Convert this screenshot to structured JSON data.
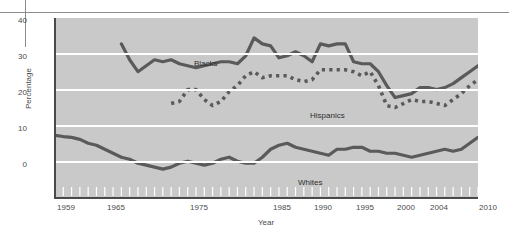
{
  "chart_data": {
    "type": "line",
    "title": "",
    "xlabel": "Year",
    "ylabel": "Percentage",
    "ylim": [
      0,
      45
    ],
    "xlim": [
      1959,
      2010
    ],
    "yticks": [
      0,
      10,
      20,
      30,
      40
    ],
    "xticks": [
      1959,
      1965,
      1975,
      1985,
      1990,
      1995,
      2000,
      2004,
      2010
    ],
    "grid": true,
    "legend_position": "inline-annotations",
    "plot_background": "#c9c9c9",
    "gridline_color": "#ffffff",
    "line_color": "#5a5a5a",
    "series": [
      {
        "name": "Blacks",
        "style": "solid",
        "color": "#5a5a5a",
        "x": [
          1967,
          1968,
          1969,
          1970,
          1971,
          1972,
          1973,
          1974,
          1975,
          1976,
          1977,
          1978,
          1979,
          1980,
          1981,
          1982,
          1983,
          1984,
          1985,
          1986,
          1987,
          1988,
          1989,
          1990,
          1991,
          1992,
          1993,
          1994,
          1995,
          1996,
          1997,
          1998,
          1999,
          2000,
          2001,
          2002,
          2003,
          2004,
          2005,
          2006,
          2007,
          2008,
          2009,
          2010
        ],
        "values": [
          38.5,
          34.5,
          31.5,
          33.0,
          34.5,
          34.0,
          34.5,
          33.5,
          33.0,
          32.5,
          33.0,
          33.5,
          34.0,
          34.0,
          33.5,
          35.5,
          40.0,
          38.5,
          38.0,
          35.0,
          35.5,
          36.5,
          35.5,
          34.0,
          38.5,
          38.0,
          38.5,
          38.5,
          34.0,
          33.5,
          33.5,
          31.5,
          28.0,
          25.0,
          25.5,
          26.0,
          27.5,
          27.5,
          27.0,
          27.5,
          28.5,
          30.0,
          31.5,
          33.0
        ]
      },
      {
        "name": "Hispanics",
        "style": "dotted",
        "color": "#5a5a5a",
        "x": [
          1973,
          1974,
          1975,
          1976,
          1977,
          1978,
          1979,
          1980,
          1981,
          1982,
          1983,
          1984,
          1985,
          1986,
          1987,
          1988,
          1989,
          1990,
          1991,
          1992,
          1993,
          1994,
          1995,
          1996,
          1997,
          1998,
          1999,
          2000,
          2001,
          2002,
          2003,
          2004,
          2005,
          2006,
          2007,
          2008,
          2009,
          2010
        ],
        "values": [
          23.5,
          24.0,
          27.0,
          27.0,
          24.5,
          23.0,
          24.0,
          26.5,
          28.0,
          30.5,
          31.5,
          30.0,
          30.5,
          30.5,
          30.5,
          29.5,
          29.0,
          29.5,
          32.0,
          32.0,
          32.0,
          32.0,
          31.5,
          30.5,
          31.5,
          28.0,
          23.0,
          22.5,
          23.5,
          24.5,
          24.0,
          24.0,
          23.5,
          23.0,
          24.5,
          26.0,
          28.0,
          29.5
        ]
      },
      {
        "name": "Whites",
        "style": "solid",
        "color": "#5a5a5a",
        "x": [
          1959,
          1960,
          1961,
          1962,
          1963,
          1964,
          1965,
          1966,
          1967,
          1968,
          1969,
          1970,
          1971,
          1972,
          1973,
          1974,
          1975,
          1976,
          1977,
          1978,
          1979,
          1980,
          1981,
          1982,
          1983,
          1984,
          1985,
          1986,
          1987,
          1988,
          1989,
          1990,
          1991,
          1992,
          1993,
          1994,
          1995,
          1996,
          1997,
          1998,
          1999,
          2000,
          2001,
          2002,
          2003,
          2004,
          2005,
          2006,
          2007,
          2008,
          2009,
          2010
        ],
        "values": [
          15.5,
          15.2,
          15.0,
          14.5,
          13.5,
          13.0,
          12.0,
          11.0,
          10.0,
          9.5,
          8.5,
          8.0,
          7.5,
          7.0,
          7.5,
          8.5,
          9.0,
          8.5,
          8.0,
          8.5,
          9.5,
          10.0,
          9.0,
          8.5,
          8.5,
          10.0,
          12.0,
          13.0,
          13.5,
          12.5,
          12.0,
          11.5,
          11.0,
          10.5,
          12.0,
          12.0,
          12.5,
          12.5,
          11.5,
          11.5,
          11.0,
          11.0,
          10.5,
          10.0,
          10.5,
          11.0,
          11.5,
          12.0,
          11.5,
          12.0,
          13.5,
          15.0
        ]
      }
    ]
  },
  "axes": {
    "ytick_labels": [
      "0",
      "10",
      "20",
      "30",
      "40"
    ],
    "xtick_labels": [
      "1959",
      "1965",
      "1975",
      "1985",
      "1990",
      "1995",
      "2000",
      "2004",
      "2010"
    ],
    "y_axis_title": "Percentage",
    "x_axis_title": "Year"
  },
  "annotations": {
    "blacks": "Blacks",
    "hispanics": "Hispanics",
    "whites": "Whites"
  }
}
